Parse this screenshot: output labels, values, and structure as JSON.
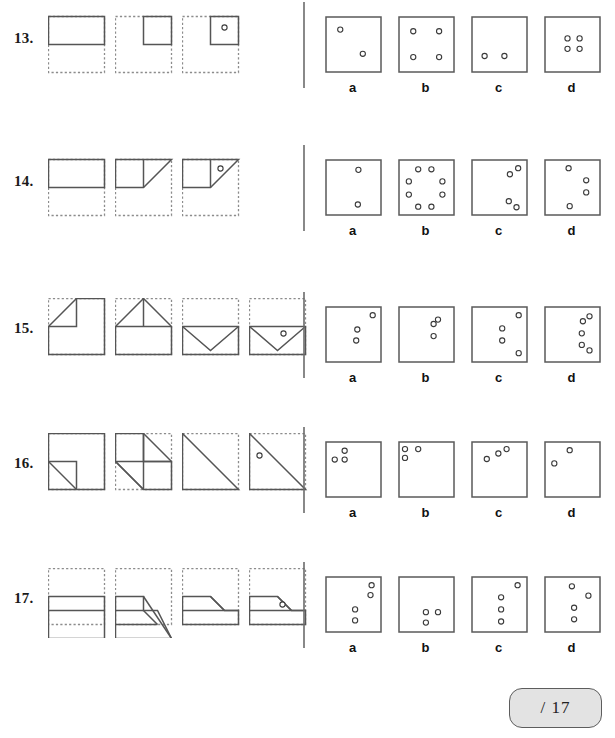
{
  "worksheet": {
    "title": "Paper folding reasoning worksheet",
    "score_label": "/ 17",
    "option_letters": [
      "a",
      "b",
      "c",
      "d"
    ]
  },
  "questions": [
    {
      "number": "13.",
      "row_top": 0,
      "fold_steps": [
        {
          "dashed_box": {
            "x": 0,
            "y": 8,
            "w": 56,
            "h": 56
          },
          "solid_shape": "rect",
          "solid": {
            "x": 0,
            "y": 8,
            "w": 56,
            "h": 28
          },
          "hole": null
        },
        {
          "dashed_box": {
            "x": 0,
            "y": 8,
            "w": 56,
            "h": 56
          },
          "solid_shape": "rect",
          "solid": {
            "x": 28,
            "y": 8,
            "w": 28,
            "h": 28
          },
          "hole": null
        },
        {
          "dashed_box": {
            "x": 0,
            "y": 8,
            "w": 56,
            "h": 56
          },
          "solid_shape": "rect",
          "solid": {
            "x": 28,
            "y": 8,
            "w": 28,
            "h": 28
          },
          "hole": {
            "cx": 42,
            "cy": 19
          }
        }
      ],
      "options": [
        {
          "letter": "a",
          "holes": [
            [
              0.25,
              0.22
            ],
            [
              0.66,
              0.66
            ]
          ]
        },
        {
          "letter": "b",
          "holes": [
            [
              0.25,
              0.25
            ],
            [
              0.72,
              0.25
            ],
            [
              0.25,
              0.72
            ],
            [
              0.72,
              0.72
            ]
          ]
        },
        {
          "letter": "c",
          "holes": [
            [
              0.22,
              0.7
            ],
            [
              0.58,
              0.7
            ]
          ]
        },
        {
          "letter": "d",
          "holes": [
            [
              0.4,
              0.38
            ],
            [
              0.62,
              0.38
            ],
            [
              0.4,
              0.57
            ],
            [
              0.62,
              0.57
            ]
          ]
        }
      ]
    },
    {
      "number": "14.",
      "row_top": 143,
      "fold_steps": [
        {
          "dashed_box": {
            "x": 0,
            "y": 8,
            "w": 56,
            "h": 56
          },
          "solid_shape": "rect",
          "solid": {
            "x": 0,
            "y": 8,
            "w": 56,
            "h": 28
          },
          "hole": null
        },
        {
          "dashed_box": {
            "x": 0,
            "y": 8,
            "w": 56,
            "h": 56
          },
          "solid_shape": "tri-right",
          "solid": {
            "x": 0,
            "y": 8,
            "w": 56,
            "h": 28
          },
          "hole": null
        },
        {
          "dashed_box": {
            "x": 0,
            "y": 8,
            "w": 56,
            "h": 56
          },
          "solid_shape": "tri-right-fold",
          "solid": {
            "x": 0,
            "y": 8,
            "w": 56,
            "h": 28
          },
          "hole": {
            "cx": 38,
            "cy": 17
          }
        }
      ],
      "options": [
        {
          "letter": "a",
          "holes": [
            [
              0.58,
              0.17
            ],
            [
              0.57,
              0.8
            ]
          ]
        },
        {
          "letter": "b",
          "holes": [
            [
              0.34,
              0.16
            ],
            [
              0.58,
              0.16
            ],
            [
              0.17,
              0.38
            ],
            [
              0.78,
              0.38
            ],
            [
              0.17,
              0.62
            ],
            [
              0.78,
              0.62
            ],
            [
              0.34,
              0.84
            ],
            [
              0.58,
              0.84
            ]
          ]
        },
        {
          "letter": "c",
          "holes": [
            [
              0.83,
              0.14
            ],
            [
              0.68,
              0.25
            ],
            [
              0.66,
              0.74
            ],
            [
              0.8,
              0.85
            ]
          ]
        },
        {
          "letter": "d",
          "holes": [
            [
              0.42,
              0.14
            ],
            [
              0.74,
              0.36
            ],
            [
              0.74,
              0.58
            ],
            [
              0.44,
              0.83
            ]
          ]
        }
      ]
    },
    {
      "number": "15.",
      "row_top": 290,
      "fold_steps": [
        {
          "dashed_box": {
            "x": 0,
            "y": 0,
            "w": 56,
            "h": 56
          },
          "solid_shape": "corner-fold-tl",
          "solid": {
            "x": 0,
            "y": 0,
            "w": 56,
            "h": 56
          },
          "hole": null
        },
        {
          "dashed_box": {
            "x": 0,
            "y": 0,
            "w": 56,
            "h": 56
          },
          "solid_shape": "house-peak",
          "solid": {
            "x": 0,
            "y": 0,
            "w": 56,
            "h": 56
          },
          "hole": null
        },
        {
          "dashed_box": {
            "x": 0,
            "y": 0,
            "w": 56,
            "h": 56
          },
          "solid_shape": "envelope",
          "solid": {
            "x": 0,
            "y": 0,
            "w": 56,
            "h": 56
          },
          "hole": null
        },
        {
          "dashed_box": {
            "x": 0,
            "y": 0,
            "w": 56,
            "h": 56
          },
          "solid_shape": "envelope",
          "solid": {
            "x": 0,
            "y": 0,
            "w": 56,
            "h": 56
          },
          "hole": {
            "cx": 34,
            "cy": 35
          }
        }
      ],
      "options": [
        {
          "letter": "a",
          "holes": [
            [
              0.84,
              0.14
            ],
            [
              0.56,
              0.4
            ],
            [
              0.54,
              0.6
            ]
          ]
        },
        {
          "letter": "b",
          "holes": [
            [
              0.7,
              0.22
            ],
            [
              0.62,
              0.3
            ],
            [
              0.62,
              0.52
            ]
          ]
        },
        {
          "letter": "c",
          "holes": [
            [
              0.84,
              0.14
            ],
            [
              0.54,
              0.38
            ],
            [
              0.54,
              0.6
            ],
            [
              0.84,
              0.83
            ]
          ]
        },
        {
          "letter": "d",
          "holes": [
            [
              0.8,
              0.16
            ],
            [
              0.68,
              0.25
            ],
            [
              0.66,
              0.47
            ],
            [
              0.66,
              0.68
            ],
            [
              0.8,
              0.78
            ]
          ]
        }
      ]
    },
    {
      "number": "16.",
      "row_top": 425,
      "fold_steps": [
        {
          "dashed_box": {
            "x": 0,
            "y": 0,
            "w": 56,
            "h": 56
          },
          "solid_shape": "notch-bl",
          "solid": {
            "x": 0,
            "y": 0,
            "w": 56,
            "h": 56
          },
          "hole": null
        },
        {
          "dashed_box": {
            "x": 0,
            "y": 0,
            "w": 56,
            "h": 56
          },
          "solid_shape": "quad-fold",
          "solid": {
            "x": 0,
            "y": 0,
            "w": 56,
            "h": 56
          },
          "hole": null
        },
        {
          "dashed_box": {
            "x": 0,
            "y": 0,
            "w": 56,
            "h": 56
          },
          "solid_shape": "tri-diag",
          "solid": {
            "x": 0,
            "y": 0,
            "w": 56,
            "h": 56
          },
          "hole": null
        },
        {
          "dashed_box": {
            "x": 0,
            "y": 0,
            "w": 56,
            "h": 56
          },
          "solid_shape": "tri-diag",
          "solid": {
            "x": 0,
            "y": 0,
            "w": 56,
            "h": 56
          },
          "hole": {
            "cx": 10,
            "cy": 22
          }
        }
      ],
      "options": [
        {
          "letter": "a",
          "holes": [
            [
              0.33,
              0.15
            ],
            [
              0.15,
              0.31
            ],
            [
              0.33,
              0.31
            ]
          ]
        },
        {
          "letter": "b",
          "holes": [
            [
              0.1,
              0.12
            ],
            [
              0.34,
              0.12
            ],
            [
              0.1,
              0.28
            ]
          ]
        },
        {
          "letter": "c",
          "holes": [
            [
              0.62,
              0.12
            ],
            [
              0.47,
              0.2
            ],
            [
              0.26,
              0.3
            ]
          ]
        },
        {
          "letter": "d",
          "holes": [
            [
              0.44,
              0.14
            ],
            [
              0.16,
              0.38
            ]
          ]
        }
      ]
    },
    {
      "number": "17.",
      "row_top": 560,
      "fold_steps": [
        {
          "dashed_box": {
            "x": 0,
            "y": 0,
            "w": 56,
            "h": 56
          },
          "solid_shape": "two-band",
          "solid": {
            "x": 0,
            "y": 14,
            "w": 56,
            "h": 42
          },
          "hole": null
        },
        {
          "dashed_box": {
            "x": 0,
            "y": 0,
            "w": 56,
            "h": 56
          },
          "solid_shape": "step-diag",
          "solid": {
            "x": 0,
            "y": 14,
            "w": 56,
            "h": 42
          },
          "hole": null
        },
        {
          "dashed_box": {
            "x": 0,
            "y": 0,
            "w": 56,
            "h": 56
          },
          "solid_shape": "low-step",
          "solid": {
            "x": 0,
            "y": 14,
            "w": 56,
            "h": 28
          },
          "hole": null
        },
        {
          "dashed_box": {
            "x": 0,
            "y": 0,
            "w": 56,
            "h": 56
          },
          "solid_shape": "low-step",
          "solid": {
            "x": 0,
            "y": 14,
            "w": 56,
            "h": 28
          },
          "hole": {
            "cx": 33,
            "cy": 36
          }
        }
      ],
      "options": [
        {
          "letter": "a",
          "holes": [
            [
              0.82,
              0.14
            ],
            [
              0.8,
              0.32
            ],
            [
              0.52,
              0.58
            ],
            [
              0.52,
              0.78
            ]
          ]
        },
        {
          "letter": "b",
          "holes": [
            [
              0.48,
              0.63
            ],
            [
              0.7,
              0.63
            ],
            [
              0.48,
              0.82
            ]
          ]
        },
        {
          "letter": "c",
          "holes": [
            [
              0.82,
              0.14
            ],
            [
              0.52,
              0.36
            ],
            [
              0.52,
              0.58
            ],
            [
              0.52,
              0.8
            ]
          ]
        },
        {
          "letter": "d",
          "holes": [
            [
              0.48,
              0.16
            ],
            [
              0.78,
              0.33
            ],
            [
              0.52,
              0.55
            ],
            [
              0.52,
              0.76
            ]
          ]
        }
      ]
    }
  ]
}
